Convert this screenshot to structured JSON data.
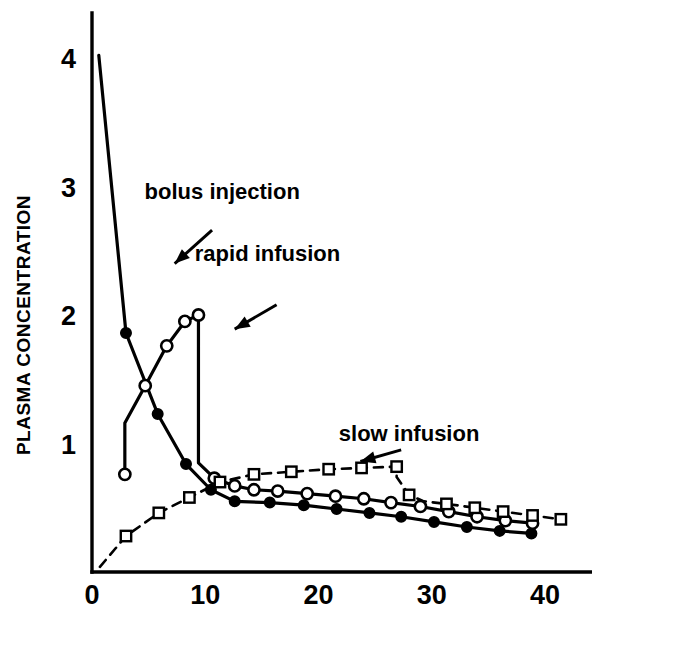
{
  "chart_data": {
    "type": "line",
    "title": "",
    "subtitle": "",
    "xlabel": "",
    "ylabel": "PLASMA CONCENTRATION",
    "xlim": [
      0,
      44
    ],
    "ylim": [
      0,
      4.35
    ],
    "xticks": [
      0,
      10,
      20,
      30,
      40
    ],
    "xticklabels": [
      "0",
      "10",
      "20",
      "30",
      "40"
    ],
    "yticks": [
      1,
      2,
      3,
      4
    ],
    "yticklabels": [
      "1",
      "2",
      "3",
      "4"
    ],
    "grid": false,
    "legend_position": "inline-annotations",
    "background_color": "#ffffff",
    "line_color": "#000000",
    "series": [
      {
        "name": "bolus injection",
        "marker": "filled-circle",
        "linestyle": "solid",
        "color": "#000000",
        "x": [
          0.6,
          3.0,
          5.8,
          8.3,
          10.5,
          12.6,
          15.7,
          18.7,
          21.6,
          24.5,
          27.3,
          30.2,
          33.1,
          36.0,
          38.8
        ],
        "y": [
          4.02,
          1.86,
          1.23,
          0.84,
          0.64,
          0.55,
          0.54,
          0.52,
          0.49,
          0.46,
          0.43,
          0.39,
          0.35,
          0.32,
          0.3
        ],
        "markers_at": [
          3.0,
          5.8,
          8.3,
          10.5,
          12.6,
          15.7,
          18.7,
          21.6,
          24.5,
          27.3,
          30.2,
          33.1,
          36.0,
          38.8
        ]
      },
      {
        "name": "rapid infusion",
        "marker": "open-circle",
        "linestyle": "solid",
        "color": "#000000",
        "x": [
          2.9,
          2.9,
          4.7,
          6.6,
          8.2,
          9.4,
          9.4,
          9.4,
          9.4,
          10.8,
          12.6,
          14.3,
          16.4,
          19.0,
          21.5,
          24.0,
          26.4,
          29.0,
          31.5,
          34.0,
          36.5,
          38.9
        ],
        "y": [
          0.76,
          1.16,
          1.45,
          1.76,
          1.95,
          2.0,
          1.77,
          1.22,
          0.85,
          0.73,
          0.67,
          0.64,
          0.63,
          0.61,
          0.59,
          0.57,
          0.54,
          0.51,
          0.47,
          0.43,
          0.4,
          0.38
        ],
        "markers_at": [
          2.9,
          4.7,
          6.6,
          8.2,
          9.4,
          10.8,
          12.6,
          14.3,
          16.4,
          19.0,
          21.5,
          24.0,
          26.4,
          29.0,
          31.5,
          34.0,
          36.5,
          38.9
        ]
      },
      {
        "name": "slow infusion",
        "marker": "open-square",
        "linestyle": "dashed",
        "color": "#000000",
        "x": [
          0.7,
          3.0,
          5.9,
          8.6,
          11.3,
          14.3,
          17.6,
          20.9,
          23.8,
          26.9,
          26.9,
          28.0,
          29.3,
          31.3,
          33.8,
          36.3,
          38.9,
          41.4
        ],
        "y": [
          0.04,
          0.28,
          0.46,
          0.58,
          0.7,
          0.76,
          0.78,
          0.8,
          0.81,
          0.82,
          0.74,
          0.6,
          0.55,
          0.53,
          0.5,
          0.47,
          0.44,
          0.41
        ],
        "markers_at": [
          3.0,
          5.9,
          8.6,
          11.3,
          14.3,
          17.6,
          20.9,
          23.8,
          26.9,
          28.0,
          31.3,
          33.8,
          36.3,
          38.9,
          41.4
        ]
      }
    ],
    "annotations": [
      {
        "label": "bolus injection",
        "text_x": 11.5,
        "text_y": 2.9,
        "arrow_from_x": 10.6,
        "arrow_from_y": 2.66,
        "arrow_to_x": 7.3,
        "arrow_to_y": 2.4
      },
      {
        "label": "rapid infusion",
        "text_x": 15.5,
        "text_y": 2.42,
        "arrow_from_x": 16.3,
        "arrow_from_y": 2.08,
        "arrow_to_x": 12.6,
        "arrow_to_y": 1.89
      },
      {
        "label": "slow infusion",
        "text_x": 28.0,
        "text_y": 1.02,
        "arrow_from_x": 27.3,
        "arrow_from_y": 0.95,
        "arrow_to_x": 23.7,
        "arrow_to_y": 0.86
      }
    ]
  }
}
